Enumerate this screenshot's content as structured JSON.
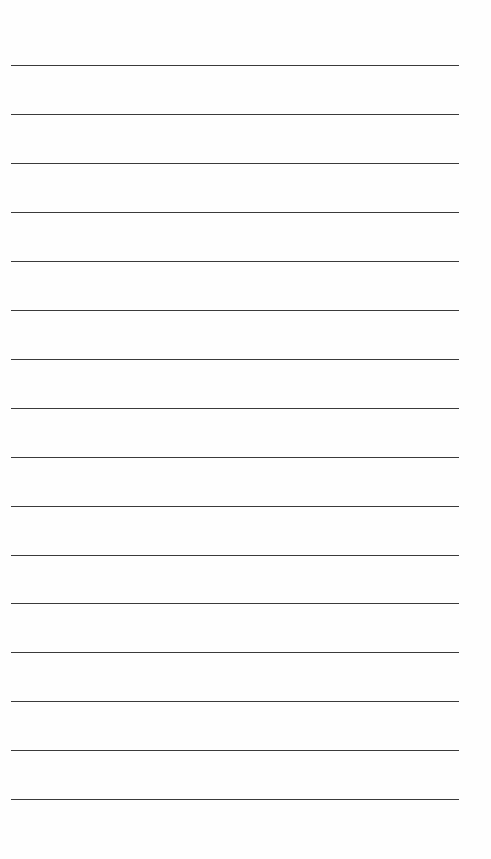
{
  "page": {
    "type": "ruled-sheet",
    "line_color": "#3a3a3a",
    "background": "#fefefe",
    "line_count": 16,
    "first_line_y": 65,
    "line_spacing": 48.95,
    "line_left": 11,
    "line_width": 448,
    "lines": [
      "",
      "",
      "",
      "",
      "",
      "",
      "",
      "",
      "",
      "",
      "",
      "",
      "",
      "",
      "",
      ""
    ]
  }
}
